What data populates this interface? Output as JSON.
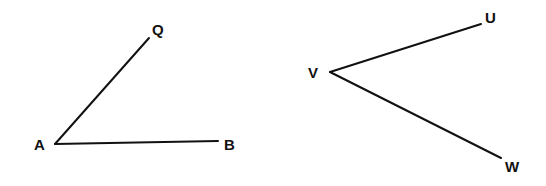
{
  "figure": {
    "background_color": "#ffffff",
    "stroke_color": "#111111",
    "label_color": "#111111",
    "stroke_width": 2,
    "canvas": {
      "width": 546,
      "height": 186
    },
    "diagrams": [
      {
        "id": "angle-qab",
        "name": "angle QAB",
        "vertex": {
          "label": "A",
          "x": 55,
          "y": 144,
          "label_x": 34,
          "label_y": 150
        },
        "rays": [
          {
            "id": "ray-aq",
            "name": "ray AQ",
            "from": "A",
            "to": "Q",
            "x1": 55,
            "y1": 144,
            "x2": 149,
            "y2": 38,
            "endpoint": {
              "label": "Q",
              "x": 149,
              "y": 38,
              "label_x": 152,
              "label_y": 35
            }
          },
          {
            "id": "ray-ab",
            "name": "ray AB",
            "from": "A",
            "to": "B",
            "x1": 55,
            "y1": 144,
            "x2": 218,
            "y2": 141,
            "endpoint": {
              "label": "B",
              "x": 218,
              "y": 141,
              "label_x": 224,
              "label_y": 150
            }
          }
        ]
      },
      {
        "id": "angle-uvw",
        "name": "angle UVW",
        "vertex": {
          "label": "V",
          "x": 330,
          "y": 72,
          "label_x": 308,
          "label_y": 78
        },
        "rays": [
          {
            "id": "ray-vu",
            "name": "ray VU",
            "from": "V",
            "to": "U",
            "x1": 330,
            "y1": 72,
            "x2": 481,
            "y2": 24,
            "endpoint": {
              "label": "U",
              "x": 481,
              "y": 24,
              "label_x": 485,
              "label_y": 23
            }
          },
          {
            "id": "ray-vw",
            "name": "ray VW",
            "from": "V",
            "to": "W",
            "x1": 330,
            "y1": 72,
            "x2": 501,
            "y2": 158,
            "endpoint": {
              "label": "W",
              "x": 501,
              "y": 158,
              "label_x": 505,
              "label_y": 172
            }
          }
        ]
      }
    ]
  }
}
